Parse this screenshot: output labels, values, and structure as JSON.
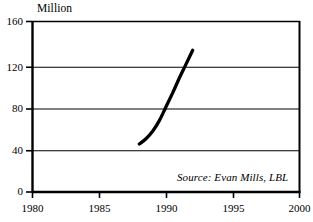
{
  "chart_data": {
    "type": "line",
    "title": "",
    "subtitle": "",
    "ylabel": "Million",
    "xlabel": "",
    "xlim": [
      1980,
      2000
    ],
    "ylim": [
      0,
      160
    ],
    "grid": true,
    "grid_axis": "y",
    "legend": "none",
    "x_ticks": [
      "1980",
      "1985",
      "1990",
      "1995",
      "2000"
    ],
    "x_tick_values": [
      1980,
      1985,
      1990,
      1995,
      2000
    ],
    "y_ticks": [
      "0",
      "40",
      "80",
      "120",
      "160"
    ],
    "y_tick_values": [
      0,
      40,
      80,
      120,
      160
    ],
    "series": [
      {
        "name": "",
        "color": "#000000",
        "x": [
          1988,
          1988.5,
          1989,
          1989.5,
          1990,
          1990.5,
          1991,
          1991.5,
          1992
        ],
        "values": [
          45,
          50,
          57,
          67,
          80,
          93,
          107,
          120,
          133
        ]
      }
    ],
    "annotations": [
      {
        "name": "source-note",
        "text": "Source: Evan Mills, LBL",
        "style": "italic",
        "position": "bottom-right"
      }
    ]
  },
  "axes": {
    "y_axis_label": "Million"
  },
  "annotation": {
    "source": "Source: Evan Mills, LBL"
  },
  "colors": {
    "series_line": "#000000",
    "frame": "#000000",
    "grid": "#000000",
    "background": "#ffffff"
  }
}
